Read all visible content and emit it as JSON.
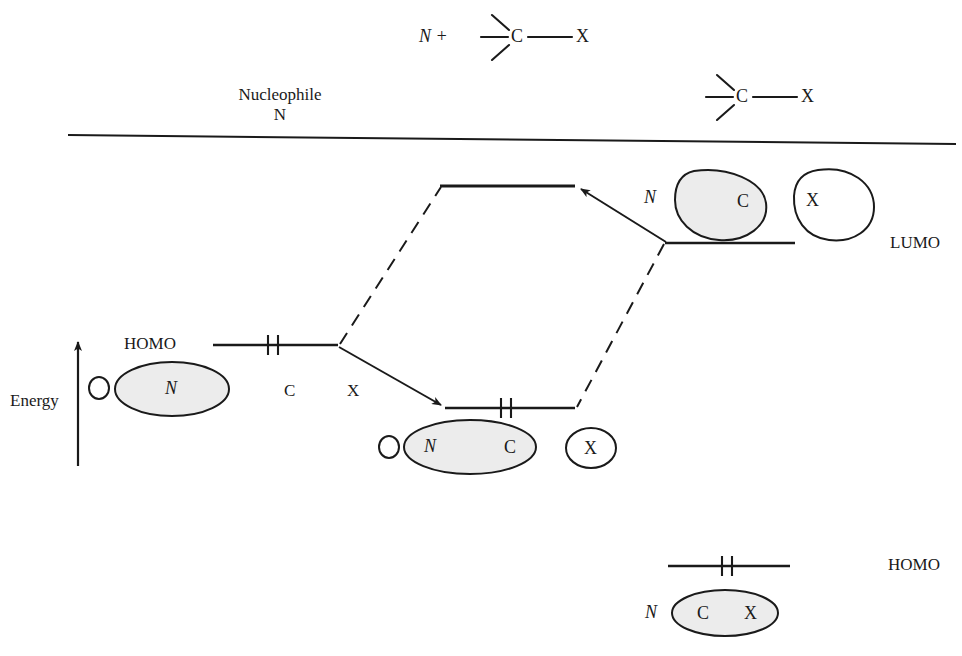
{
  "figure": {
    "type": "molecular-orbital-correlation-diagram",
    "title_reaction": "Nucleophilic substitution frontier orbital interaction",
    "axis_label": "Energy",
    "colors": {
      "line": "#1a1a1a",
      "lobe_shaded_fill": "#ececec",
      "lobe_empty_fill": "#ffffff",
      "background": "#ffffff"
    }
  },
  "top_scheme": {
    "reagent_label": "N +",
    "nucleophile_caption_line1": "Nucleophile",
    "nucleophile_caption_line2": "N",
    "reactant_center_atom": "C",
    "reactant_leaving_group": "X",
    "product_center_atom": "C",
    "product_leaving_group": "X"
  },
  "levels": {
    "reactant_homo": {
      "label": "HOMO",
      "electrons": "2",
      "lobe_small": "",
      "lobe_main_atom": "N",
      "atom_caption_c": "C",
      "atom_caption_x": "X"
    },
    "reactant_lumo": {
      "label": "LUMO",
      "lobe_n": "N",
      "lobe_c_atom": "C",
      "lobe_x_atom": "X"
    },
    "product_antibonding": {
      "label": "",
      "electrons": "0"
    },
    "product_bonding": {
      "label": "",
      "electrons": "2",
      "lobe_main_left_atom": "N",
      "lobe_main_right_atom": "C",
      "lobe_separate_atom": "X"
    },
    "product_homo": {
      "label": "HOMO",
      "electrons": "2",
      "nucleophile_label": "N",
      "lobe_left_atom": "C",
      "lobe_right_atom": "X"
    }
  }
}
